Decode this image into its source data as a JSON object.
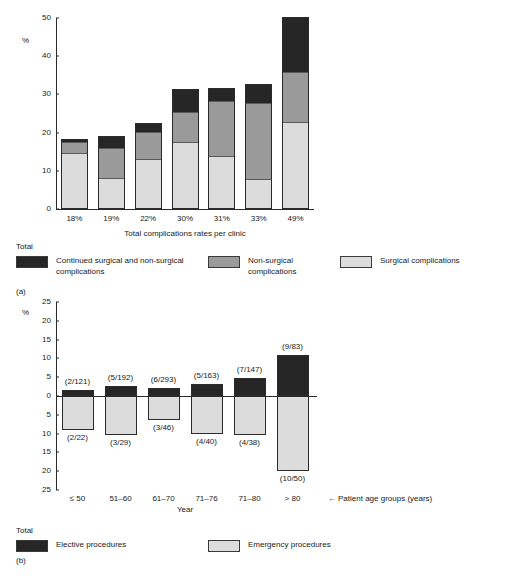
{
  "figure_a": {
    "panel_tag": "(a)",
    "y_unit": "%",
    "x_title": "Total complications rates per clinic",
    "legend_total_label": "Total",
    "legend": [
      {
        "label": "Continued surgical and non-surgical complications",
        "color": "#262626",
        "name": "continued-surgical-and-non-surgical"
      },
      {
        "label": "Non-surgical complications",
        "color": "#9a9a9a",
        "name": "non-surgical"
      },
      {
        "label": "Surgical complications",
        "color": "#dcdcdc",
        "name": "surgical"
      }
    ]
  },
  "figure_b": {
    "panel_tag": "(b)",
    "y_unit": "%",
    "x_title": "Year",
    "annotation": "Patient age groups (years)",
    "arrow_glyph": "←",
    "legend_total_label": "Total",
    "legend": [
      {
        "label": "Elective procedures",
        "color": "#262626",
        "name": "elective-procedures"
      },
      {
        "label": "Emergency procedures",
        "color": "#dcdcdc",
        "name": "emergency-procedures"
      }
    ]
  },
  "chart_data": [
    {
      "id": "a",
      "type": "bar",
      "stacked": true,
      "title": "",
      "xlabel": "Total complications rates per clinic",
      "ylabel": "%",
      "ylim": [
        0,
        50
      ],
      "yticks": [
        0,
        10,
        20,
        30,
        40,
        50
      ],
      "grid": false,
      "legend_position": "below",
      "categories": [
        "18%",
        "19%",
        "22%",
        "30%",
        "31%",
        "33%",
        "49%"
      ],
      "series": [
        {
          "name": "Surgical complications",
          "color": "#dcdcdc",
          "values": [
            14.8,
            8.2,
            13.1,
            17.6,
            13.8,
            7.8,
            22.8
          ]
        },
        {
          "name": "Non-surgical complications",
          "color": "#9a9a9a",
          "values": [
            3.1,
            8.0,
            7.4,
            7.9,
            14.6,
            20.0,
            13.2
          ]
        },
        {
          "name": "Continued surgical and non-surgical complications",
          "color": "#262626",
          "values": [
            0.3,
            3.0,
            1.9,
            6.0,
            3.4,
            5.0,
            14.2
          ]
        }
      ],
      "totals": [
        18.2,
        19.2,
        22.4,
        31.5,
        31.8,
        32.8,
        50.2
      ]
    },
    {
      "id": "b",
      "type": "bar",
      "stacked": false,
      "diverging": true,
      "title": "",
      "xlabel": "Year",
      "ylabel": "%",
      "ylim": [
        -25,
        25
      ],
      "yticks_up": [
        0,
        5,
        10,
        15,
        20,
        25
      ],
      "yticks_down": [
        5,
        10,
        15,
        20,
        25
      ],
      "grid": false,
      "legend_position": "below",
      "annotation": "Patient age groups (years)",
      "categories": [
        "≤ 50",
        "51–60",
        "61–70",
        "71–76",
        "71–80",
        "> 80"
      ],
      "series": [
        {
          "name": "Elective procedures",
          "color": "#262626",
          "direction": "up",
          "values": [
            1.65,
            2.6,
            2.05,
            3.07,
            4.76,
            10.84
          ],
          "labels": [
            "(2/121)",
            "(5/192)",
            "(6/293)",
            "(5/163)",
            "(7/147)",
            "(9/83)"
          ]
        },
        {
          "name": "Emergency procedures",
          "color": "#dcdcdc",
          "direction": "down",
          "values": [
            9.1,
            10.3,
            6.5,
            10.0,
            10.5,
            20.0
          ],
          "labels": [
            "(2/22)",
            "(3/29)",
            "(3/46)",
            "(4/40)",
            "(4/38)",
            "(10/50)"
          ]
        }
      ]
    }
  ]
}
